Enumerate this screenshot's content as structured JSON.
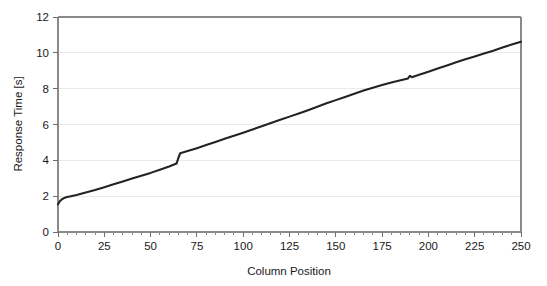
{
  "chart_data": {
    "type": "line",
    "title": "",
    "xlabel": "Column Position",
    "ylabel": "Response Time [s]",
    "xlim": [
      0,
      250
    ],
    "ylim": [
      0,
      12
    ],
    "grid": "horizontal-major-only",
    "legend": "none",
    "x_major_ticks": [
      0,
      25,
      50,
      75,
      100,
      125,
      150,
      175,
      200,
      225,
      250
    ],
    "x_tick_labels": [
      "0",
      "25",
      "50",
      "75",
      "100",
      "125",
      "150",
      "175",
      "200",
      "225",
      "250"
    ],
    "x_minor_tick_step": 5,
    "y_major_ticks": [
      0,
      2,
      4,
      6,
      8,
      10,
      12
    ],
    "y_tick_labels": [
      "0",
      "2",
      "4",
      "6",
      "8",
      "10",
      "12"
    ],
    "series": [
      {
        "name": "Response Time",
        "color": "#232323",
        "x": [
          0,
          1,
          2,
          3,
          4,
          5,
          7,
          10,
          13,
          16,
          20,
          25,
          30,
          35,
          40,
          45,
          50,
          55,
          60,
          64,
          65,
          66,
          70,
          75,
          80,
          85,
          90,
          95,
          100,
          105,
          110,
          115,
          120,
          125,
          130,
          135,
          140,
          145,
          150,
          155,
          160,
          165,
          170,
          175,
          180,
          185,
          189,
          190,
          191,
          195,
          200,
          205,
          210,
          215,
          220,
          225,
          230,
          235,
          240,
          245,
          250
        ],
        "y": [
          1.55,
          1.72,
          1.82,
          1.88,
          1.92,
          1.95,
          2.0,
          2.07,
          2.15,
          2.23,
          2.34,
          2.5,
          2.66,
          2.82,
          2.98,
          3.14,
          3.3,
          3.48,
          3.66,
          3.82,
          4.13,
          4.4,
          4.52,
          4.68,
          4.85,
          5.02,
          5.2,
          5.37,
          5.54,
          5.72,
          5.9,
          6.08,
          6.26,
          6.44,
          6.62,
          6.8,
          6.99,
          7.18,
          7.36,
          7.54,
          7.72,
          7.9,
          8.05,
          8.2,
          8.34,
          8.47,
          8.57,
          8.72,
          8.64,
          8.78,
          8.95,
          9.13,
          9.3,
          9.47,
          9.64,
          9.8,
          9.96,
          10.12,
          10.3,
          10.46,
          10.62
        ]
      }
    ]
  },
  "figure": {
    "background": "#ffffff",
    "axis_color": "#8a8a8a",
    "grid_color": "#e9e9e9",
    "text_color": "#1a1a1a"
  }
}
